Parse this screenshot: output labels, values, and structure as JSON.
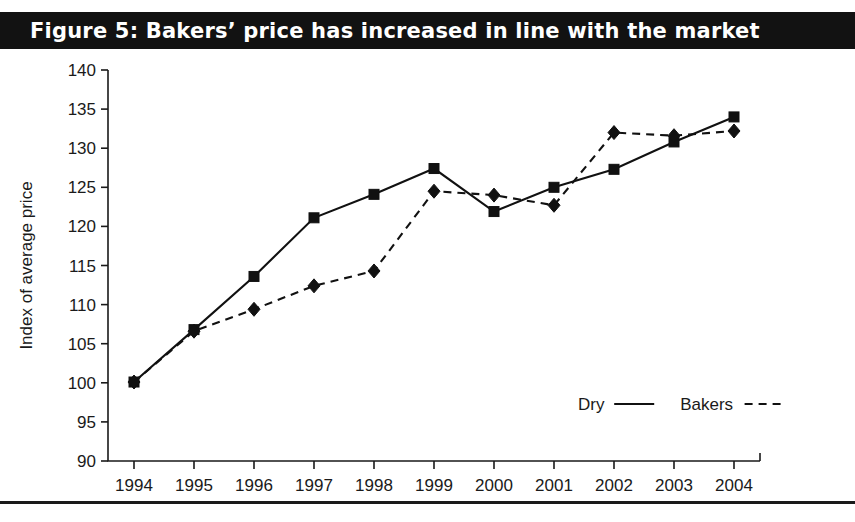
{
  "figure": {
    "title": "Figure 5: Bakers’ price has increased in line with the market",
    "title_bar_color": "#121212",
    "title_text_color": "#ffffff",
    "background_color": "#ffffff",
    "footer_note": ""
  },
  "chart_data": {
    "type": "line",
    "title": "Figure 5: Bakers’ price has increased in line with the market",
    "xlabel": "",
    "ylabel": "Index of average price",
    "x": [
      "1994",
      "1995",
      "1996",
      "1997",
      "1998",
      "1999",
      "2000",
      "2001",
      "2002",
      "2003",
      "2004"
    ],
    "categories": [
      "1994",
      "1995",
      "1996",
      "1997",
      "1998",
      "1999",
      "2000",
      "2001",
      "2002",
      "2003",
      "2004"
    ],
    "ylim": [
      90,
      140
    ],
    "yticks": [
      90,
      95,
      100,
      105,
      110,
      115,
      120,
      125,
      130,
      135,
      140
    ],
    "ytick_labels": [
      "90",
      "95",
      "100",
      "105",
      "110",
      "115",
      "120",
      "125",
      "130",
      "135",
      "140"
    ],
    "grid": false,
    "legend_position": "lower right",
    "series": [
      {
        "name": "Dry",
        "marker": "square",
        "linestyle": "solid",
        "color": "#111111",
        "values": [
          100.1,
          106.8,
          113.6,
          121.1,
          124.1,
          127.4,
          121.9,
          125.0,
          127.3,
          130.8,
          134.0
        ]
      },
      {
        "name": "Bakers",
        "marker": "diamond",
        "linestyle": "dashed",
        "color": "#111111",
        "values": [
          100.1,
          106.6,
          109.4,
          112.4,
          114.3,
          124.5,
          124.0,
          122.7,
          132.0,
          131.6,
          132.2
        ]
      }
    ],
    "legend": [
      {
        "label": "Dry",
        "linestyle": "solid"
      },
      {
        "label": "Bakers",
        "linestyle": "dashed"
      }
    ]
  }
}
